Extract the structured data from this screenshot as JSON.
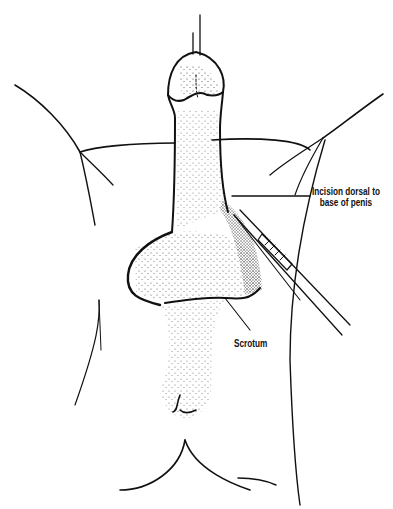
{
  "figure": {
    "type": "surgical-anatomical-line-illustration",
    "ink_color": "#111111",
    "background_color": "#ffffff"
  },
  "labels": {
    "incision_line1": "Incision dorsal to",
    "incision_line2": "base of penis",
    "scrotum": "Scrotum"
  },
  "signature": {
    "text": "~~~~ '70"
  }
}
